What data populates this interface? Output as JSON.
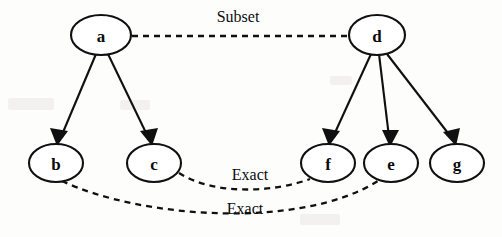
{
  "diagram": {
    "background_color": "#fdfdfc",
    "stroke_color": "#101010",
    "nodes": [
      {
        "id": "a",
        "label": "a",
        "cx": 101,
        "cy": 35,
        "rx": 30,
        "ry": 20
      },
      {
        "id": "d",
        "label": "d",
        "cx": 377,
        "cy": 35,
        "rx": 28,
        "ry": 20
      },
      {
        "id": "b",
        "label": "b",
        "cx": 56,
        "cy": 163,
        "rx": 27,
        "ry": 19
      },
      {
        "id": "c",
        "label": "c",
        "cx": 154,
        "cy": 163,
        "rx": 27,
        "ry": 19
      },
      {
        "id": "f",
        "label": "f",
        "cx": 328,
        "cy": 163,
        "rx": 27,
        "ry": 19
      },
      {
        "id": "e",
        "label": "e",
        "cx": 391,
        "cy": 163,
        "rx": 27,
        "ry": 19
      },
      {
        "id": "g",
        "label": "g",
        "cx": 457,
        "cy": 163,
        "rx": 27,
        "ry": 19
      }
    ],
    "solid_edges": [
      {
        "from": "a",
        "to": "b",
        "x1": 96,
        "y1": 54,
        "x2": 60,
        "y2": 142,
        "arrow": true
      },
      {
        "from": "a",
        "to": "c",
        "x1": 108,
        "y1": 54,
        "x2": 148,
        "y2": 142,
        "arrow": true
      },
      {
        "from": "d",
        "to": "f",
        "x1": 370,
        "y1": 54,
        "x2": 332,
        "y2": 142,
        "arrow": true
      },
      {
        "from": "d",
        "to": "e",
        "x1": 378,
        "y1": 54,
        "x2": 389,
        "y2": 142,
        "arrow": true
      },
      {
        "from": "d",
        "to": "g",
        "x1": 386,
        "y1": 54,
        "x2": 450,
        "y2": 142,
        "arrow": true
      }
    ],
    "dashed_edges": [
      {
        "from": "a",
        "to": "d",
        "label": "Subset",
        "path": "M 132 36 L 349 36",
        "label_x": 238,
        "label_y": 22
      },
      {
        "from": "c",
        "to": "f",
        "label": "Exact",
        "path": "M 179 173 C 215 196, 275 192, 310 179",
        "label_x": 250,
        "label_y": 180
      },
      {
        "from": "b",
        "to": "e",
        "label": "Exact",
        "path": "M 62 181 C 140 218, 300 230, 378 181",
        "label_x": 245,
        "label_y": 214
      }
    ],
    "labels": {
      "subset": "Subset",
      "exact_upper": "Exact",
      "exact_lower": "Exact"
    }
  }
}
